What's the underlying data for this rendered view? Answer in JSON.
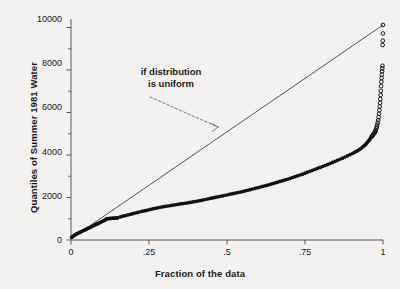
{
  "chart_data": {
    "type": "scatter",
    "title": "",
    "subtitle": "",
    "xlabel": "Fraction of the data",
    "ylabel": "Quantiles of Summer 1981 Water",
    "xlim": [
      0,
      1
    ],
    "ylim": [
      0,
      10400
    ],
    "grid": false,
    "legend_position": "none",
    "xticks": [
      0,
      0.25,
      0.5,
      0.75,
      1
    ],
    "xtick_labels": [
      "0",
      ".25",
      ".5",
      ".75",
      "1"
    ],
    "yticks": [
      0,
      2000,
      4000,
      6000,
      8000,
      10000
    ],
    "ytick_labels": [
      "0",
      "2000",
      "4000",
      "6000",
      "8000",
      "10000"
    ],
    "yticks_minor": [
      1000,
      3000,
      5000,
      7000,
      9000
    ],
    "annotations": [
      {
        "text": "if distribution\nis uniform",
        "x": 0.21,
        "y": 7450,
        "arrow_to_x": 0.47,
        "arrow_to_y": 5000,
        "style": "dashed-arrow"
      }
    ],
    "series": [
      {
        "name": "Quantile plot (filled markers)",
        "marker": "filled-circle",
        "color": "#101010",
        "x": [
          0.002,
          0.006,
          0.01,
          0.014,
          0.018,
          0.022,
          0.026,
          0.03,
          0.034,
          0.038,
          0.042,
          0.046,
          0.05,
          0.054,
          0.058,
          0.062,
          0.066,
          0.07,
          0.074,
          0.078,
          0.082,
          0.086,
          0.09,
          0.094,
          0.098,
          0.102,
          0.106,
          0.11,
          0.114,
          0.118,
          0.122,
          0.126,
          0.13,
          0.134,
          0.138,
          0.142,
          0.146,
          0.15,
          0.158,
          0.166,
          0.174,
          0.182,
          0.19,
          0.198,
          0.206,
          0.214,
          0.222,
          0.23,
          0.238,
          0.246,
          0.254,
          0.262,
          0.27,
          0.278,
          0.286,
          0.294,
          0.302,
          0.31,
          0.318,
          0.326,
          0.334,
          0.342,
          0.35,
          0.358,
          0.366,
          0.374,
          0.382,
          0.39,
          0.398,
          0.406,
          0.414,
          0.422,
          0.43,
          0.438,
          0.446,
          0.454,
          0.462,
          0.47,
          0.478,
          0.486,
          0.494,
          0.502,
          0.51,
          0.518,
          0.526,
          0.534,
          0.542,
          0.55,
          0.558,
          0.566,
          0.574,
          0.582,
          0.59,
          0.598,
          0.606,
          0.614,
          0.622,
          0.63,
          0.638,
          0.646,
          0.654,
          0.662,
          0.67,
          0.678,
          0.686,
          0.694,
          0.702,
          0.71,
          0.718,
          0.726,
          0.734,
          0.742,
          0.75,
          0.758,
          0.766,
          0.774,
          0.782,
          0.79,
          0.798,
          0.806,
          0.814,
          0.822,
          0.83,
          0.838,
          0.846,
          0.854,
          0.862,
          0.87,
          0.878,
          0.886,
          0.894,
          0.902,
          0.908,
          0.914,
          0.92,
          0.926,
          0.931,
          0.936,
          0.941,
          0.945,
          0.949,
          0.953,
          0.956,
          0.959,
          0.962
        ],
        "y": [
          120,
          175,
          215,
          250,
          285,
          315,
          345,
          375,
          400,
          430,
          460,
          490,
          515,
          545,
          575,
          600,
          630,
          660,
          690,
          720,
          745,
          770,
          800,
          830,
          860,
          890,
          920,
          950,
          1000,
          1005,
          1010,
          1015,
          1020,
          1025,
          1030,
          1035,
          1040,
          1045,
          1090,
          1120,
          1150,
          1180,
          1210,
          1240,
          1270,
          1300,
          1330,
          1355,
          1380,
          1410,
          1440,
          1465,
          1490,
          1515,
          1540,
          1560,
          1580,
          1600,
          1620,
          1640,
          1660,
          1680,
          1700,
          1715,
          1730,
          1750,
          1770,
          1790,
          1810,
          1830,
          1855,
          1880,
          1905,
          1930,
          1955,
          1980,
          2005,
          2030,
          2055,
          2080,
          2105,
          2130,
          2155,
          2180,
          2205,
          2230,
          2255,
          2280,
          2310,
          2340,
          2370,
          2400,
          2430,
          2460,
          2490,
          2520,
          2550,
          2580,
          2615,
          2650,
          2685,
          2720,
          2755,
          2790,
          2825,
          2860,
          2900,
          2940,
          2980,
          3020,
          3060,
          3100,
          3145,
          3190,
          3235,
          3280,
          3325,
          3370,
          3415,
          3460,
          3505,
          3550,
          3600,
          3650,
          3700,
          3750,
          3800,
          3850,
          3905,
          3960,
          4015,
          4070,
          4120,
          4170,
          4220,
          4275,
          4330,
          4390,
          4450,
          4510,
          4580,
          4650,
          4710,
          4770,
          4830
        ]
      },
      {
        "name": "Upper tail (open markers)",
        "marker": "open-circle",
        "color": "#101010",
        "x": [
          0.964,
          0.966,
          0.968,
          0.97,
          0.972,
          0.974,
          0.9755,
          0.977,
          0.9785,
          0.98,
          0.9815,
          0.983,
          0.9845,
          0.986,
          0.9872,
          0.9884,
          0.9896,
          0.9906,
          0.9916,
          0.9924,
          0.9932,
          0.994,
          0.9948,
          0.9956,
          0.9963,
          0.997,
          0.9976,
          0.9982,
          0.9988,
          0.9994,
          0.9997,
          1.0
        ],
        "y": [
          4870,
          4910,
          4950,
          4990,
          5030,
          5070,
          5120,
          5180,
          5250,
          5330,
          5420,
          5520,
          5640,
          5780,
          5940,
          6110,
          6280,
          6450,
          6630,
          6820,
          7020,
          7240,
          7450,
          7620,
          7780,
          7940,
          8080,
          8200,
          9180,
          9380,
          9720,
          10120
        ]
      },
      {
        "name": "Uniform reference line",
        "marker": "line",
        "color": "#3a3a3a",
        "x": [
          0,
          1
        ],
        "y": [
          60,
          10120
        ]
      }
    ]
  },
  "axes": {
    "ylabel": "Quantiles of Summer 1981 Water",
    "xlabel": "Fraction of the data",
    "ytick_labels": [
      "10000",
      "8000",
      "6000",
      "4000",
      "2000",
      "0"
    ],
    "xtick_labels": [
      "0",
      ".25",
      ".5",
      ".75",
      "1"
    ]
  },
  "annotation": {
    "line1": "if distribution",
    "line2": "is uniform",
    "full": "if distribution\nis uniform"
  },
  "colors": {
    "background": "#f2f1ef",
    "ink": "#1a1a1a",
    "marker": "#101010",
    "reference_line": "#3a3a3a",
    "axis": "#4a4a4a"
  }
}
